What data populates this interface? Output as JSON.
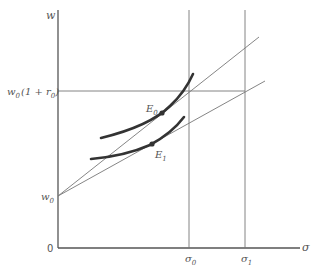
{
  "diagram": {
    "axes": {
      "y_label": "w",
      "x_label": "σ",
      "origin_label": "0"
    },
    "y_ticks": [
      {
        "id": "w0",
        "main": "w",
        "sub": "0",
        "rest": ""
      },
      {
        "id": "w0r0",
        "main": "w",
        "sub": "0",
        "rest": "(1 + r",
        "sub2": "0",
        "close": ")"
      }
    ],
    "x_ticks": [
      {
        "id": "sigma0",
        "main": "σ",
        "sub": "0"
      },
      {
        "id": "sigma1",
        "main": "σ",
        "sub": "1"
      }
    ],
    "points": [
      {
        "id": "E0",
        "main": "E",
        "sub": "0"
      },
      {
        "id": "E1",
        "main": "E",
        "sub": "1"
      }
    ],
    "colors": {
      "axis": "#555555",
      "thin_line": "#777777",
      "curve": "#333333"
    }
  }
}
